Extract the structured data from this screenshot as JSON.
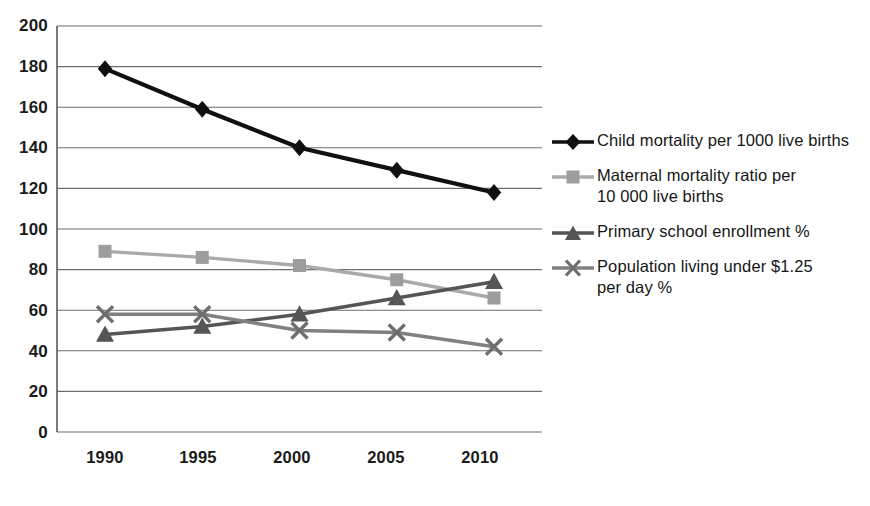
{
  "chart_data": {
    "type": "line",
    "title": "",
    "xlabel": "",
    "ylabel": "",
    "x": [
      1990,
      1995,
      2000,
      2005,
      2010
    ],
    "categories": [
      "1990",
      "1995",
      "2000",
      "2005",
      "2010"
    ],
    "ylim": [
      0,
      200
    ],
    "ytick_step": 20,
    "yticks": [
      0,
      20,
      40,
      60,
      80,
      100,
      120,
      140,
      160,
      180,
      200
    ],
    "ytick_labels": [
      "0",
      "20",
      "40",
      "60",
      "80",
      "100",
      "120",
      "140",
      "160",
      "180",
      "200"
    ],
    "grid": "horizontal",
    "legend_position": "right",
    "series": [
      {
        "name": "Child mortality per 1000 live births",
        "marker": "diamond",
        "color": "#101010",
        "values": [
          179,
          159,
          140,
          129,
          118
        ]
      },
      {
        "name": "Maternal mortality ratio per\n10 000 live births",
        "marker": "square",
        "color": "#aaaaaa",
        "values": [
          89,
          86,
          82,
          75,
          66
        ]
      },
      {
        "name": "Primary school enrollment %",
        "marker": "triangle",
        "color": "#555555",
        "values": [
          48,
          52,
          58,
          66,
          74
        ]
      },
      {
        "name": "Population living under $1.25\nper day %",
        "marker": "x",
        "color": "#808080",
        "values": [
          58,
          58,
          50,
          49,
          42
        ]
      }
    ]
  },
  "legend": {
    "items": [
      {
        "label": "Child mortality per 1000 live births",
        "marker": "diamond-marker-icon",
        "color": "#101010"
      },
      {
        "label": "Maternal mortality ratio per\n10 000 live births",
        "marker": "square-marker-icon",
        "color": "#aaaaaa"
      },
      {
        "label": "Primary school enrollment %",
        "marker": "triangle-marker-icon",
        "color": "#555555"
      },
      {
        "label": "Population living under $1.25\nper day %",
        "marker": "x-marker-icon",
        "color": "#808080"
      }
    ]
  },
  "axes": {
    "y_labels": [
      "200",
      "180",
      "160",
      "140",
      "120",
      "100",
      "80",
      "60",
      "40",
      "20",
      "0"
    ],
    "x_labels": [
      "1990",
      "1995",
      "2000",
      "2005",
      "2010"
    ]
  },
  "colors": {
    "axis": "#5a5a5a",
    "grid": "#6d6d6d",
    "text": "#1a1a1a",
    "series_child_mortality": "#101010",
    "series_maternal_mortality": "#aaaaaa",
    "series_primary_school": "#555555",
    "series_population_poverty": "#808080"
  }
}
